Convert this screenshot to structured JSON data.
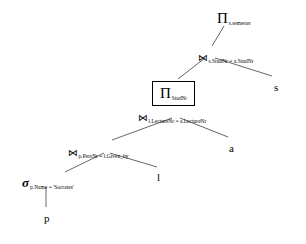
{
  "diagram": {
    "type": "query-tree",
    "background_color": "#ffffff",
    "line_color": "#555555",
    "text_color": "#000000"
  },
  "nodes": [
    {
      "id": "projection-top",
      "kind": "projection",
      "glyph": "Π",
      "subscript": "s.semester",
      "boxed": false,
      "x": 217,
      "y": 10
    },
    {
      "id": "join-studnr",
      "kind": "join",
      "glyph": "⋈",
      "subscript": "s.StudNr = a.StudNr",
      "boxed": false,
      "x": 198,
      "y": 48
    },
    {
      "id": "projection-studnr",
      "kind": "projection",
      "glyph": "Π",
      "subscript": "StudNr",
      "boxed": true,
      "x": 152,
      "y": 81
    },
    {
      "id": "join-lecturenr",
      "kind": "join",
      "glyph": "⋈",
      "subscript": "l.LectureNr = a.LectureNr",
      "boxed": false,
      "x": 138,
      "y": 108
    },
    {
      "id": "join-persnr",
      "kind": "join",
      "glyph": "⋈",
      "subscript": "p.PersNr = l.Given_by",
      "boxed": false,
      "x": 68,
      "y": 143
    },
    {
      "id": "selection-name",
      "kind": "selection",
      "glyph": "σ",
      "subscript": "p.Name = 'Socrates'",
      "boxed": false,
      "x": 22,
      "y": 174
    }
  ],
  "leaves": [
    {
      "id": "leaf-s",
      "label": "s",
      "x": 274,
      "y": 82
    },
    {
      "id": "leaf-a",
      "label": "a",
      "x": 229,
      "y": 143
    },
    {
      "id": "leaf-l",
      "label": "l",
      "x": 157,
      "y": 172
    },
    {
      "id": "leaf-p",
      "label": "p",
      "x": 44,
      "y": 213
    }
  ],
  "edges": [
    {
      "id": "edge-projection-top-to-join-studnr",
      "x1": 224,
      "y1": 26,
      "x2": 212,
      "y2": 46
    },
    {
      "id": "edge-join-studnr-to-projection-studnr",
      "x1": 205,
      "y1": 58,
      "x2": 178,
      "y2": 79
    },
    {
      "id": "edge-join-studnr-to-leaf-s",
      "x1": 215,
      "y1": 58,
      "x2": 272,
      "y2": 76
    },
    {
      "id": "edge-projection-studnr-to-join-lecturenr",
      "x1": 178,
      "y1": 99,
      "x2": 177,
      "y2": 106
    },
    {
      "id": "edge-join-lecturenr-to-join-persnr",
      "x1": 172,
      "y1": 118,
      "x2": 112,
      "y2": 140
    },
    {
      "id": "edge-join-lecturenr-to-leaf-a",
      "x1": 180,
      "y1": 118,
      "x2": 228,
      "y2": 137
    },
    {
      "id": "edge-join-persnr-to-selection-name",
      "x1": 104,
      "y1": 153,
      "x2": 65,
      "y2": 172
    },
    {
      "id": "edge-join-persnr-to-leaf-l",
      "x1": 110,
      "y1": 153,
      "x2": 157,
      "y2": 167
    },
    {
      "id": "edge-selection-name-to-leaf-p",
      "x1": 46,
      "y1": 187,
      "x2": 46,
      "y2": 207
    }
  ]
}
